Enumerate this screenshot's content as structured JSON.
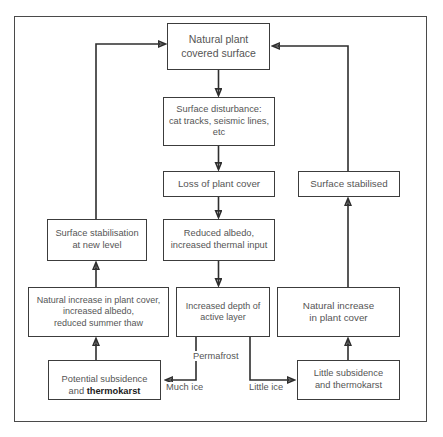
{
  "diagram": {
    "type": "flowchart",
    "colors": {
      "border": "#3c3c3c",
      "frame": "#4a4a4a",
      "text": "#555555",
      "emphasis_text": "#1c1c1c",
      "background": "#ffffff",
      "line": "#2e2e2e"
    },
    "nodes": [
      {
        "id": "natural-plant-covered-surface",
        "label": "Natural plant\ncovered surface",
        "x": 167,
        "y": 23,
        "w": 103,
        "h": 47,
        "font_size": 10.5
      },
      {
        "id": "surface-disturbance",
        "label": "Surface disturbance:\ncat tracks, seismic lines,\netc",
        "x": 163,
        "y": 97,
        "w": 112,
        "h": 49,
        "font_size": 9.3
      },
      {
        "id": "loss-of-plant-cover",
        "label": "Loss of plant cover",
        "x": 163,
        "y": 171,
        "w": 112,
        "h": 26,
        "font_size": 9.8
      },
      {
        "id": "surface-stabilised",
        "label": "Surface stabilised",
        "x": 298,
        "y": 171,
        "w": 102,
        "h": 26,
        "font_size": 9.8
      },
      {
        "id": "reduced-albedo",
        "label": "Reduced albedo,\nincreased thermal input",
        "x": 163,
        "y": 219,
        "w": 112,
        "h": 42,
        "font_size": 9.3
      },
      {
        "id": "surface-stabilisation-new-level",
        "label": "Surface stabilisation\nat new level",
        "x": 47,
        "y": 219,
        "w": 100,
        "h": 42,
        "font_size": 9.3
      },
      {
        "id": "natural-increase-plant-cover-albedo-thaw",
        "label": "Natural increase in plant cover,\nincreased albedo,\nreduced summer thaw",
        "x": 28,
        "y": 287,
        "w": 141,
        "h": 50,
        "font_size": 9.0
      },
      {
        "id": "increased-depth-active-layer",
        "label": "Increased depth of\nactive layer",
        "x": 176,
        "y": 287,
        "w": 94,
        "h": 50,
        "font_size": 9.0
      },
      {
        "id": "natural-increase-in-plant-cover",
        "label": "Natural increase\nin plant cover",
        "x": 277,
        "y": 287,
        "w": 123,
        "h": 50,
        "font_size": 9.8
      },
      {
        "id": "potential-subsidence-thermokarst",
        "label_prefix": "Potential subsidence\nand ",
        "label_bold": "thermokarst",
        "x": 48,
        "y": 360,
        "w": 113,
        "h": 40,
        "font_size": 9.3
      },
      {
        "id": "little-subsidence-thermokarst",
        "label": "Little subsidence\nand thermokarst",
        "x": 297,
        "y": 360,
        "w": 103,
        "h": 40,
        "font_size": 9.3
      }
    ],
    "edge_labels": [
      {
        "id": "permafrost",
        "text": "Permafrost",
        "x": 191,
        "y": 351,
        "font_size": 9.3
      },
      {
        "id": "much-ice",
        "text": "Much ice",
        "x": 164,
        "y": 392,
        "font_size": 9.3
      },
      {
        "id": "little-ice",
        "text": "Little ice",
        "x": 247,
        "y": 392,
        "font_size": 9.3
      }
    ],
    "edges": [
      {
        "from": "natural-plant-covered-surface",
        "to": "surface-disturbance",
        "kind": "arrow-down"
      },
      {
        "from": "surface-disturbance",
        "to": "loss-of-plant-cover",
        "kind": "arrow-down"
      },
      {
        "from": "loss-of-plant-cover",
        "to": "reduced-albedo",
        "kind": "arrow-down"
      },
      {
        "from": "reduced-albedo",
        "to": "increased-depth-active-layer",
        "kind": "arrow-down"
      },
      {
        "from": "natural-increase-plant-cover-albedo-thaw",
        "to": "surface-stabilisation-new-level",
        "kind": "arrow-up"
      },
      {
        "from": "potential-subsidence-thermokarst",
        "to": "natural-increase-plant-cover-albedo-thaw",
        "kind": "arrow-up"
      },
      {
        "from": "surface-stabilisation-new-level",
        "to": "natural-plant-covered-surface",
        "kind": "elbow-left-feedback"
      },
      {
        "from": "little-subsidence-thermokarst",
        "to": "natural-increase-in-plant-cover",
        "kind": "arrow-up"
      },
      {
        "from": "natural-increase-in-plant-cover",
        "to": "surface-stabilised",
        "kind": "arrow-up"
      },
      {
        "from": "surface-stabilised",
        "to": "natural-plant-covered-surface",
        "kind": "elbow-right-feedback"
      },
      {
        "from": "increased-depth-active-layer",
        "to": "potential-subsidence-thermokarst",
        "kind": "branch-much-ice"
      },
      {
        "from": "increased-depth-active-layer",
        "to": "little-subsidence-thermokarst",
        "kind": "branch-little-ice"
      }
    ]
  }
}
